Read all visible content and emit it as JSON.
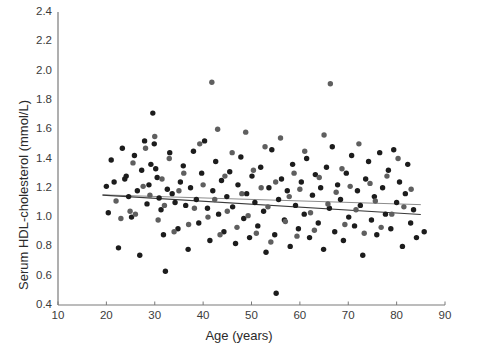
{
  "chart_data": {
    "type": "scatter",
    "title": "",
    "xlabel": "Age (years)",
    "ylabel": "Serum HDL-cholesterol (mmol/L)",
    "xlim": [
      10,
      90
    ],
    "ylim": [
      0.4,
      2.4
    ],
    "xticks": [
      10,
      20,
      30,
      40,
      50,
      60,
      70,
      80,
      90
    ],
    "yticks": [
      0.4,
      0.6,
      0.8,
      1.0,
      1.2,
      1.4,
      1.6,
      1.8,
      2.0,
      2.2,
      2.4
    ],
    "xtick_labels": [
      "10",
      "20",
      "30",
      "40",
      "50",
      "60",
      "70",
      "80",
      "90"
    ],
    "ytick_labels": [
      "0.4",
      "0.6",
      "0.8",
      "1.0",
      "1.2",
      "1.4",
      "1.6",
      "1.8",
      "2.0",
      "2.2",
      "2.4"
    ],
    "grid": false,
    "legend": "none",
    "marker": {
      "shape": "circle",
      "size_px": 5.4,
      "color_dark": "#1c1c1c",
      "color_gray": "#5f5f5f"
    },
    "series": [
      {
        "name": "Participants (dark)",
        "color": "#1c1c1c",
        "points": [
          [
            20.0,
            1.21
          ],
          [
            20.4,
            1.03
          ],
          [
            21.0,
            1.39
          ],
          [
            21.6,
            1.24
          ],
          [
            22.5,
            0.79
          ],
          [
            23.3,
            1.47
          ],
          [
            23.8,
            1.26
          ],
          [
            24.1,
            1.28
          ],
          [
            24.6,
            1.14
          ],
          [
            25.2,
            1.0
          ],
          [
            25.8,
            1.42
          ],
          [
            26.4,
            1.18
          ],
          [
            26.9,
            0.74
          ],
          [
            27.3,
            1.32
          ],
          [
            27.9,
            1.52
          ],
          [
            28.4,
            1.09
          ],
          [
            28.8,
            1.22
          ],
          [
            29.2,
            1.36
          ],
          [
            29.6,
            1.71
          ],
          [
            29.9,
            1.5
          ],
          [
            30.2,
            1.33
          ],
          [
            30.5,
            1.27
          ],
          [
            30.9,
            1.13
          ],
          [
            31.3,
            1.05
          ],
          [
            31.8,
            0.88
          ],
          [
            32.2,
            0.63
          ],
          [
            32.6,
            1.19
          ],
          [
            33.1,
            1.44
          ],
          [
            33.6,
            1.16
          ],
          [
            34.2,
            1.1
          ],
          [
            34.8,
            0.92
          ],
          [
            35.3,
            1.24
          ],
          [
            35.9,
            1.35
          ],
          [
            36.4,
            1.08
          ],
          [
            36.9,
            0.78
          ],
          [
            37.4,
            1.2
          ],
          [
            38.0,
            1.45
          ],
          [
            38.6,
            1.12
          ],
          [
            39.1,
            0.96
          ],
          [
            39.7,
            1.3
          ],
          [
            40.3,
            1.52
          ],
          [
            40.9,
            1.06
          ],
          [
            41.4,
            0.84
          ],
          [
            42.0,
            1.18
          ],
          [
            42.6,
            1.38
          ],
          [
            43.2,
            1.02
          ],
          [
            43.8,
            1.25
          ],
          [
            44.3,
            0.9
          ],
          [
            44.9,
            1.14
          ],
          [
            45.5,
            1.31
          ],
          [
            46.1,
            1.07
          ],
          [
            46.7,
            0.82
          ],
          [
            47.2,
            1.22
          ],
          [
            47.8,
            1.41
          ],
          [
            48.4,
            0.99
          ],
          [
            49.0,
            1.16
          ],
          [
            49.6,
            0.86
          ],
          [
            50.1,
            1.28
          ],
          [
            50.7,
            1.1
          ],
          [
            51.3,
            0.94
          ],
          [
            51.9,
            1.34
          ],
          [
            52.5,
            1.04
          ],
          [
            53.0,
            0.76
          ],
          [
            53.6,
            1.2
          ],
          [
            54.2,
            1.46
          ],
          [
            54.8,
            0.88
          ],
          [
            55.1,
            0.48
          ],
          [
            55.6,
            1.12
          ],
          [
            56.2,
            1.26
          ],
          [
            56.8,
            0.98
          ],
          [
            57.4,
            1.18
          ],
          [
            58.0,
            0.8
          ],
          [
            58.5,
            1.36
          ],
          [
            59.1,
            1.08
          ],
          [
            59.7,
            0.92
          ],
          [
            60.3,
            1.24
          ],
          [
            60.9,
            1.02
          ],
          [
            61.4,
            1.4
          ],
          [
            62.0,
            0.86
          ],
          [
            62.6,
            1.15
          ],
          [
            63.2,
            1.29
          ],
          [
            63.8,
            0.96
          ],
          [
            64.3,
            1.2
          ],
          [
            64.9,
            0.78
          ],
          [
            65.5,
            1.34
          ],
          [
            66.1,
            1.06
          ],
          [
            66.7,
            1.48
          ],
          [
            67.2,
            0.9
          ],
          [
            67.8,
            1.22
          ],
          [
            68.4,
            1.12
          ],
          [
            69.0,
            0.84
          ],
          [
            69.6,
            1.3
          ],
          [
            70.1,
            1.0
          ],
          [
            70.7,
            1.42
          ],
          [
            71.3,
            0.94
          ],
          [
            71.9,
            1.18
          ],
          [
            72.5,
            1.08
          ],
          [
            73.0,
            0.74
          ],
          [
            73.6,
            1.26
          ],
          [
            74.2,
            1.38
          ],
          [
            74.8,
            0.98
          ],
          [
            75.4,
            1.14
          ],
          [
            75.9,
            0.88
          ],
          [
            76.5,
            1.44
          ],
          [
            77.1,
            1.2
          ],
          [
            77.7,
            1.02
          ],
          [
            78.3,
            1.32
          ],
          [
            78.8,
            0.92
          ],
          [
            79.4,
            1.46
          ],
          [
            80.0,
            1.1
          ],
          [
            80.6,
            1.24
          ],
          [
            81.2,
            0.8
          ],
          [
            81.8,
            1.16
          ],
          [
            82.3,
            1.36
          ],
          [
            82.9,
            0.96
          ],
          [
            83.5,
            1.05
          ],
          [
            84.1,
            0.86
          ],
          [
            85.7,
            0.9
          ]
        ]
      },
      {
        "name": "Participants (gray)",
        "color": "#5f5f5f",
        "points": [
          [
            22.0,
            1.11
          ],
          [
            23.0,
            0.99
          ],
          [
            24.9,
            1.04
          ],
          [
            25.5,
            1.37
          ],
          [
            26.0,
            1.02
          ],
          [
            27.6,
            1.21
          ],
          [
            28.1,
            1.47
          ],
          [
            29.0,
            1.15
          ],
          [
            30.0,
            1.55
          ],
          [
            30.7,
            0.98
          ],
          [
            31.5,
            1.26
          ],
          [
            32.0,
            1.08
          ],
          [
            33.0,
            1.4
          ],
          [
            34.0,
            0.9
          ],
          [
            35.0,
            1.18
          ],
          [
            36.0,
            1.3
          ],
          [
            37.0,
            0.95
          ],
          [
            38.2,
            1.06
          ],
          [
            39.3,
            1.5
          ],
          [
            40.0,
            1.22
          ],
          [
            41.0,
            1.0
          ],
          [
            41.8,
            1.92
          ],
          [
            42.4,
            1.12
          ],
          [
            43.0,
            1.6
          ],
          [
            43.5,
            0.88
          ],
          [
            44.5,
            1.28
          ],
          [
            45.0,
            1.04
          ],
          [
            46.0,
            1.44
          ],
          [
            47.0,
            0.93
          ],
          [
            48.0,
            1.16
          ],
          [
            48.8,
            1.58
          ],
          [
            49.3,
            1.01
          ],
          [
            50.4,
            1.32
          ],
          [
            51.0,
            0.89
          ],
          [
            52.0,
            1.2
          ],
          [
            52.8,
            1.48
          ],
          [
            53.4,
            1.07
          ],
          [
            54.0,
            0.83
          ],
          [
            55.0,
            1.24
          ],
          [
            56.0,
            1.54
          ],
          [
            57.0,
            0.97
          ],
          [
            57.8,
            1.14
          ],
          [
            58.8,
            1.3
          ],
          [
            59.4,
            0.87
          ],
          [
            60.0,
            1.19
          ],
          [
            61.0,
            1.45
          ],
          [
            62.2,
            1.03
          ],
          [
            63.0,
            0.91
          ],
          [
            64.0,
            1.27
          ],
          [
            65.0,
            1.56
          ],
          [
            65.8,
            1.09
          ],
          [
            66.3,
            1.91
          ],
          [
            67.5,
            1.17
          ],
          [
            68.7,
            1.33
          ],
          [
            69.3,
            0.95
          ],
          [
            70.4,
            1.21
          ],
          [
            71.6,
            1.05
          ],
          [
            72.2,
            1.5
          ],
          [
            73.3,
            0.89
          ],
          [
            74.5,
            1.23
          ],
          [
            75.6,
            1.11
          ],
          [
            76.8,
            0.93
          ],
          [
            78.0,
            1.28
          ],
          [
            79.0,
            1.02
          ],
          [
            80.3,
            1.4
          ],
          [
            81.5,
            1.07
          ],
          [
            83.0,
            1.19
          ]
        ]
      }
    ],
    "trend_lines": [
      {
        "name": "reference-line",
        "color": "#8c8c8c",
        "width_px": 1.0,
        "x_start": 19.2,
        "y_start": 1.152,
        "x_end": 85.0,
        "y_end": 1.085
      },
      {
        "name": "regression-line",
        "color": "#3a3a3a",
        "width_px": 1.1,
        "x_start": 19.2,
        "y_start": 1.15,
        "x_end": 85.0,
        "y_end": 1.018
      }
    ],
    "axis_color": "#7a7a7a"
  }
}
